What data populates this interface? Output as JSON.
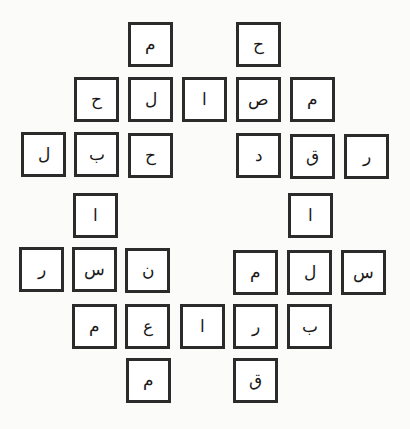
{
  "puzzle": {
    "type": "arabic-letter-grid",
    "tiles": [
      {
        "letter": "م",
        "x": 128,
        "y": 22
      },
      {
        "letter": "ح",
        "x": 236,
        "y": 22
      },
      {
        "letter": "ح",
        "x": 74,
        "y": 77
      },
      {
        "letter": "ل",
        "x": 128,
        "y": 77
      },
      {
        "letter": "ا",
        "x": 182,
        "y": 77
      },
      {
        "letter": "ص",
        "x": 236,
        "y": 77
      },
      {
        "letter": "م",
        "x": 290,
        "y": 77
      },
      {
        "letter": "ل",
        "x": 21,
        "y": 132
      },
      {
        "letter": "ب",
        "x": 74,
        "y": 132
      },
      {
        "letter": "ح",
        "x": 128,
        "y": 133
      },
      {
        "letter": "د",
        "x": 236,
        "y": 133
      },
      {
        "letter": "ق",
        "x": 290,
        "y": 134
      },
      {
        "letter": "ر",
        "x": 344,
        "y": 134
      },
      {
        "letter": "ا",
        "x": 73,
        "y": 193
      },
      {
        "letter": "ا",
        "x": 288,
        "y": 193
      },
      {
        "letter": "ر",
        "x": 19,
        "y": 247
      },
      {
        "letter": "س",
        "x": 72,
        "y": 247
      },
      {
        "letter": "ن",
        "x": 125,
        "y": 248
      },
      {
        "letter": "م",
        "x": 233,
        "y": 250
      },
      {
        "letter": "ل",
        "x": 287,
        "y": 250
      },
      {
        "letter": "س",
        "x": 341,
        "y": 250
      },
      {
        "letter": "م",
        "x": 72,
        "y": 304
      },
      {
        "letter": "ع",
        "x": 125,
        "y": 304
      },
      {
        "letter": "ا",
        "x": 180,
        "y": 304
      },
      {
        "letter": "ر",
        "x": 233,
        "y": 304
      },
      {
        "letter": "ب",
        "x": 287,
        "y": 304
      },
      {
        "letter": "م",
        "x": 126,
        "y": 358
      },
      {
        "letter": "ق",
        "x": 233,
        "y": 358
      }
    ]
  }
}
